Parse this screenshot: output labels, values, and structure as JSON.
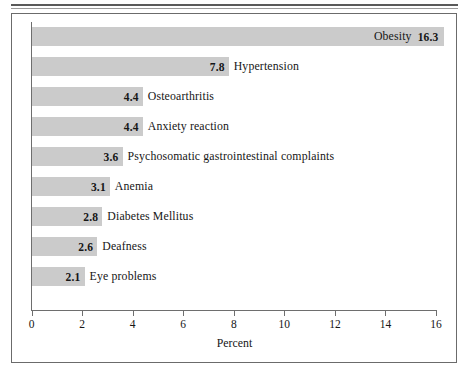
{
  "figure": {
    "axis_title": "Percent"
  },
  "chart_data": {
    "type": "bar",
    "orientation": "horizontal",
    "title": "",
    "xlabel": "Percent",
    "ylabel": "",
    "xlim": [
      0,
      16
    ],
    "xticks": [
      0,
      2,
      4,
      6,
      8,
      10,
      12,
      14,
      16
    ],
    "xtick_labels": [
      "0",
      "2",
      "4",
      "6",
      "8",
      "10",
      "12",
      "14",
      "16"
    ],
    "grid": false,
    "legend": false,
    "bar_color": "#cbcbcb",
    "categories": [
      "Obesity",
      "Hypertension",
      "Osteoarthritis",
      "Anxiety reaction",
      "Psychosomatic gastrointestinal complaints",
      "Anemia",
      "Diabetes Mellitus",
      "Deafness",
      "Eye problems"
    ],
    "values": [
      16.3,
      7.8,
      4.4,
      4.4,
      3.6,
      3.1,
      2.8,
      2.6,
      2.1
    ],
    "value_labels": [
      "16.3",
      "7.8",
      "4.4",
      "4.4",
      "3.6",
      "3.1",
      "2.8",
      "2.6",
      "2.1"
    ],
    "bars": [
      {
        "label": "Obesity",
        "value": 16.3,
        "value_label": "16.3",
        "label_inside": true
      },
      {
        "label": "Hypertension",
        "value": 7.8,
        "value_label": "7.8",
        "label_inside": false
      },
      {
        "label": "Osteoarthritis",
        "value": 4.4,
        "value_label": "4.4",
        "label_inside": false
      },
      {
        "label": "Anxiety reaction",
        "value": 4.4,
        "value_label": "4.4",
        "label_inside": false
      },
      {
        "label": "Psychosomatic gastrointestinal complaints",
        "value": 3.6,
        "value_label": "3.6",
        "label_inside": false
      },
      {
        "label": "Anemia",
        "value": 3.1,
        "value_label": "3.1",
        "label_inside": false
      },
      {
        "label": "Diabetes Mellitus",
        "value": 2.8,
        "value_label": "2.8",
        "label_inside": false
      },
      {
        "label": "Deafness",
        "value": 2.6,
        "value_label": "2.6",
        "label_inside": false
      },
      {
        "label": "Eye problems",
        "value": 2.1,
        "value_label": "2.1",
        "label_inside": false
      }
    ]
  }
}
